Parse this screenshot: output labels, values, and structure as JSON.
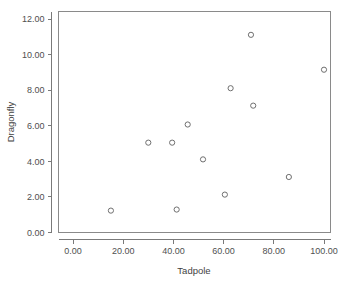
{
  "chart_data": {
    "type": "scatter",
    "title": "",
    "xlabel": "Tadpole",
    "ylabel": "Dragonfly",
    "xlim": [
      -6,
      104
    ],
    "ylim": [
      -0.7,
      12.5
    ],
    "grid": false,
    "legend": "none",
    "marker_style": "open-circle",
    "marker_color": "#6f6f6f",
    "xticks": [
      0,
      20,
      40,
      60,
      80,
      100
    ],
    "xtick_labels": [
      "0.00",
      "20.00",
      "40.00",
      "60.00",
      "80.00",
      "100.00"
    ],
    "yticks": [
      0,
      2,
      4,
      6,
      8,
      10,
      12
    ],
    "ytick_labels": [
      "0.00",
      "2.00",
      "4.00",
      "6.00",
      "8.00",
      "10.00",
      "12.00"
    ],
    "x": [
      15.1,
      30.0,
      39.5,
      41.3,
      45.7,
      51.8,
      60.5,
      62.8,
      70.9,
      71.8,
      86.0,
      100.0
    ],
    "y": [
      1.23,
      5.05,
      5.05,
      1.29,
      6.07,
      4.11,
      2.13,
      8.11,
      11.11,
      7.13,
      3.12,
      9.15
    ],
    "points": [
      {
        "x": 15.1,
        "y": 1.23
      },
      {
        "x": 30.0,
        "y": 5.05
      },
      {
        "x": 39.5,
        "y": 5.05
      },
      {
        "x": 41.3,
        "y": 1.29
      },
      {
        "x": 45.7,
        "y": 6.07
      },
      {
        "x": 51.8,
        "y": 4.11
      },
      {
        "x": 60.5,
        "y": 2.13
      },
      {
        "x": 62.8,
        "y": 8.11
      },
      {
        "x": 70.9,
        "y": 11.11
      },
      {
        "x": 71.8,
        "y": 7.13
      },
      {
        "x": 86.0,
        "y": 3.12
      },
      {
        "x": 100.0,
        "y": 9.15
      }
    ]
  },
  "axes": {
    "x_title": "Tadpole",
    "y_title": "Dragonfly"
  }
}
